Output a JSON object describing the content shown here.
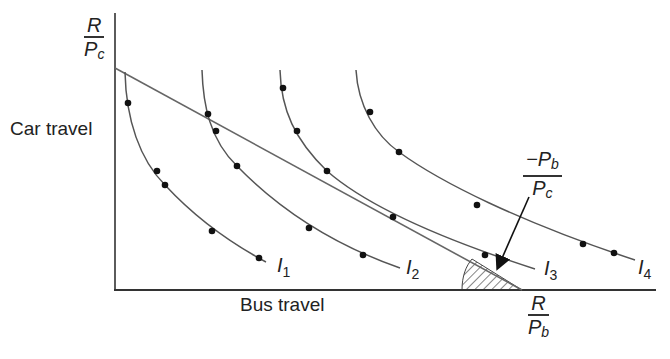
{
  "diagram": {
    "axes": {
      "y_label": "Car travel",
      "x_label": "Bus travel",
      "y_intercept": {
        "numerator": "R",
        "denominator_var": "P",
        "denominator_sub": "c"
      },
      "x_intercept": {
        "numerator": "R",
        "denominator_var": "P",
        "denominator_sub": "b"
      }
    },
    "slope_annotation": {
      "numerator_var": "−P",
      "numerator_sub": "b",
      "denominator_var": "P",
      "denominator_sub": "c"
    },
    "indifference_curves": [
      {
        "var": "I",
        "sub": "1"
      },
      {
        "var": "I",
        "sub": "2"
      },
      {
        "var": "I",
        "sub": "3"
      },
      {
        "var": "I",
        "sub": "4"
      }
    ],
    "colors": {
      "line": "#555555",
      "axis": "#333333",
      "dot": "#111111",
      "hatch": "#444444"
    }
  }
}
